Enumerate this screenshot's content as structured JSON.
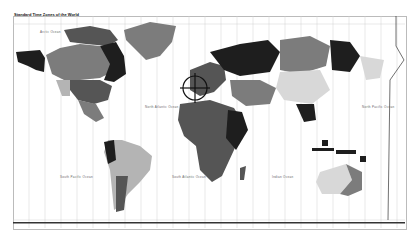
{
  "map": {
    "title": "Standard Time Zones of the World",
    "oceans": [
      {
        "name": "Arctic Ocean",
        "x": 40,
        "y": 30
      },
      {
        "name": "North Atlantic Ocean",
        "x": 145,
        "y": 105
      },
      {
        "name": "South Pacific Ocean",
        "x": 60,
        "y": 175
      },
      {
        "name": "South Atlantic Ocean",
        "x": 172,
        "y": 175
      },
      {
        "name": "Indian Ocean",
        "x": 280,
        "y": 175
      },
      {
        "name": "North Pacific Ocean",
        "x": 370,
        "y": 105
      },
      {
        "name": "South Pacific Ocean",
        "x": 372,
        "y": 170
      }
    ],
    "colors": {
      "dark": "#1e1e1e",
      "medium_dark": "#555555",
      "medium": "#7c7c7c",
      "light": "#b4b4b4",
      "very_light": "#d8d8d8",
      "grid": "#cfcfcf",
      "background": "#ffffff"
    },
    "marker": {
      "type": "crosshair",
      "cx": 195,
      "cy": 88,
      "r": 12
    }
  }
}
